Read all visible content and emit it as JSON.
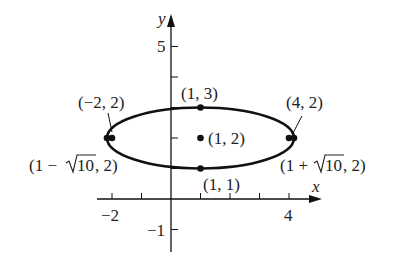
{
  "figure": {
    "type": "ellipse-graph",
    "axes": {
      "x_label": "x",
      "y_label": "y",
      "x_ticks": [
        -2,
        -1,
        1,
        2,
        3,
        4
      ],
      "x_tick_labels": [
        {
          "value": -2,
          "text": "−2"
        },
        {
          "value": 4,
          "text": "4"
        }
      ],
      "y_ticks": [
        -1,
        1,
        2,
        3,
        4,
        5
      ],
      "y_tick_labels": [
        {
          "value": 5,
          "text": "5"
        },
        {
          "value": -1,
          "text": "−1"
        }
      ],
      "x_range": [
        -2.2,
        5
      ],
      "y_range": [
        -1.7,
        6
      ]
    },
    "ellipse": {
      "center": [
        1,
        2
      ],
      "semi_major": 3.1623,
      "semi_minor": 1,
      "equation": "(x-1)^2/10 + (y-2)^2 = 1"
    },
    "points": [
      {
        "id": "center",
        "x": 1,
        "y": 2,
        "label": "(1, 2)"
      },
      {
        "id": "top",
        "x": 1,
        "y": 3,
        "label": "(1, 3)"
      },
      {
        "id": "bottom",
        "x": 1,
        "y": 1,
        "label": "(1, 1)"
      },
      {
        "id": "focus-left",
        "x": -2,
        "y": 2,
        "label": "(−2, 2)"
      },
      {
        "id": "focus-right",
        "x": 4,
        "y": 2,
        "label": "(4, 2)"
      },
      {
        "id": "vertex-left",
        "x": -2.1623,
        "y": 2,
        "label": "(1 − √10, 2)"
      },
      {
        "id": "vertex-right",
        "x": 4.1623,
        "y": 2,
        "label": "(1 + √10, 2)"
      }
    ],
    "labels": {
      "center": "(1, 2)",
      "top": "(1, 3)",
      "bottom": "(1, 1)",
      "focus_left": "(−2, 2)",
      "focus_right": "(4, 2)",
      "vertex_left_pre": "(1 −",
      "vertex_left_rad": "10",
      "vertex_left_post": ", 2)",
      "vertex_right_pre": "(1 +",
      "vertex_right_rad": "10",
      "vertex_right_post": ", 2)",
      "tick_x_neg2": "−2",
      "tick_x_4": "4",
      "tick_y_5": "5",
      "tick_y_neg1": "−1",
      "x_axis": "x",
      "y_axis": "y"
    },
    "colors": {
      "stroke": "#111111",
      "text": "#222222",
      "background": "#ffffff"
    }
  }
}
